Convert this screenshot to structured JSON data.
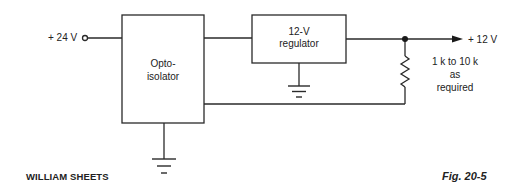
{
  "diagram": {
    "input_label": "+ 24 V",
    "output_label": "+ 12 V",
    "optoisolator": {
      "line1": "Opto-",
      "line2": "isolator"
    },
    "regulator": {
      "line1": "12-V",
      "line2": "regulator"
    },
    "resistor_note": {
      "line1": "1 k to 10 k",
      "line2": "as",
      "line3": "required"
    },
    "credit": "WILLIAM SHEETS",
    "figure_label": "Fig. 20-5"
  },
  "colors": {
    "line": "#2a2a2a",
    "text": "#222222",
    "background": "#ffffff"
  }
}
